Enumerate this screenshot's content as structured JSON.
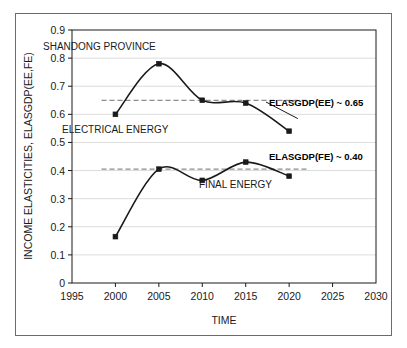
{
  "chart_data": {
    "type": "line",
    "title": "SHANDONG PROVINCE",
    "xlabel": "TIME",
    "ylabel": "INCOME ELASTICITIES, ELASGDP(EE,FE)",
    "x": [
      2000,
      2005,
      2010,
      2015,
      2020
    ],
    "xlim": [
      1995,
      2030
    ],
    "ylim": [
      0,
      0.9
    ],
    "xticks": [
      "1995",
      "2000",
      "2005",
      "2010",
      "2015",
      "2020",
      "2025",
      "2030"
    ],
    "yticks": [
      "0",
      "0.1",
      "0.2",
      "0.3",
      "0.4",
      "0.5",
      "0.6",
      "0.7",
      "0.8",
      "0.9"
    ],
    "grid": "horizontal",
    "legend": "inline-annotations",
    "marker": "square",
    "line_smoothing": "spline",
    "series": [
      {
        "name": "ELECTRICAL ENERGY",
        "values": [
          0.6,
          0.78,
          0.65,
          0.64,
          0.54
        ],
        "color": "#1a1a1a",
        "label_x": 2000.6,
        "label_y": 0.555
      },
      {
        "name": "FINAL ENERGY",
        "values": [
          0.165,
          0.405,
          0.365,
          0.43,
          0.38
        ],
        "color": "#1a1a1a",
        "label_x": 2010.9,
        "label_y": 0.345
      }
    ],
    "reference_lines": [
      {
        "name": "ELASGDP(EE) ~ 0.65",
        "value": 0.65,
        "style": "dashed",
        "color": "#8c8c8c",
        "label": "ELASGDP(EE) ~ 0.65"
      },
      {
        "name": "ELASGDP(FE) ~ 0.40",
        "value": 0.405,
        "style": "dashed",
        "color": "#8c8c8c",
        "label": "ELASGDP(FE) ~ 0.40"
      }
    ],
    "annotations": [
      {
        "text": "SHANDONG PROVINCE",
        "x": 43,
        "y": 50
      },
      {
        "text": "ELECTRICAL ENERGY",
        "x": 62,
        "y": 133
      },
      {
        "text": "FINAL ENERGY",
        "x": 199,
        "y": 188
      },
      {
        "text": "ELASGDP(EE) ~ 0.65",
        "x": 269,
        "y": 106
      },
      {
        "text": "ELASGDP(FE) ~ 0.40",
        "x": 269,
        "y": 160
      }
    ]
  },
  "axes": {
    "y_tick_labels": [
      "0.9",
      "0.8",
      "0.7",
      "0.6",
      "0.5",
      "0.4",
      "0.3",
      "0.2",
      "0.1",
      "0"
    ],
    "x_tick_labels": [
      "1995",
      "2000",
      "2005",
      "2010",
      "2015",
      "2020",
      "2025",
      "2030"
    ],
    "x_title": "TIME",
    "y_title": "INCOME ELASTICITIES, ELASGDP(EE,FE)"
  },
  "colors": {
    "frame": "#6b6b6b",
    "plot_border": "#1a1a1a",
    "gridline": "#dcdcdc",
    "series_line": "#1a1a1a",
    "reference_line": "#8c8c8c",
    "text": "#1a1a1a",
    "background": "#ffffff"
  }
}
